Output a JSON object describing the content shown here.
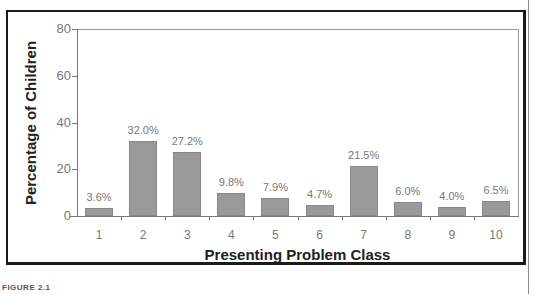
{
  "chart_data": {
    "type": "bar",
    "title": "",
    "xlabel": "Presenting Problem Class",
    "ylabel": "Percentage of Children",
    "categories": [
      "1",
      "2",
      "3",
      "4",
      "5",
      "6",
      "7",
      "8",
      "9",
      "10"
    ],
    "values": [
      3.6,
      32.0,
      27.2,
      9.8,
      7.9,
      4.7,
      21.5,
      6.0,
      4.0,
      6.5
    ],
    "bar_labels": [
      "3.6%",
      "32.0%",
      "27.2%",
      "9.8%",
      "7.9%",
      "4.7%",
      "21.5%",
      "6.0%",
      "4.0%",
      "6.5%"
    ],
    "ylim": [
      0,
      80
    ],
    "yticks": [
      "0",
      "20",
      "40",
      "60",
      "80"
    ],
    "grid": false,
    "legend": null,
    "bar_color": "#9a9a9a"
  },
  "caption": "FIGURE 2.1"
}
